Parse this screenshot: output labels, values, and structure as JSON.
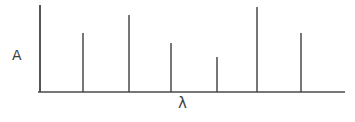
{
  "figure": {
    "kind": "line-spectrum-sketch",
    "background_color": "#ffffff",
    "ink_color": "#4a4a4a",
    "text_color": "#3d3d3d"
  },
  "axes": {
    "y_label": "A",
    "x_label": "λ",
    "y_axis": {
      "x": 40,
      "y_top": 5,
      "y_bottom": 92
    },
    "x_axis": {
      "y": 92,
      "x_left": 38,
      "x_right": 345
    },
    "ticks": "none",
    "gridlines": "none"
  },
  "chart_data": {
    "type": "bar",
    "title": "",
    "subtitle": "",
    "xlabel": "λ",
    "ylabel": "A",
    "grid": false,
    "legend": "none",
    "orientation": "vertical",
    "note": "Hand-drawn absorption/emission line spectrum: seven discrete vertical lines of differing height on a wavelength axis.",
    "categories": [
      "1",
      "2",
      "3",
      "4",
      "5",
      "6",
      "7"
    ],
    "x": [
      40,
      83,
      129,
      171,
      217,
      257,
      301
    ],
    "values": [
      87,
      59,
      77,
      49,
      35,
      85,
      59
    ],
    "tops_y": [
      5,
      33,
      15,
      43,
      57,
      7,
      33
    ],
    "baseline_y": 92,
    "xlim": [
      38,
      345
    ],
    "ylim": [
      0,
      87
    ],
    "xtick_labels": [],
    "ytick_labels": []
  }
}
